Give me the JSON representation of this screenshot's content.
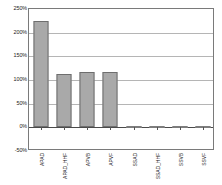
{
  "chart_data": {
    "type": "bar",
    "title": "",
    "xlabel": "",
    "ylabel": "",
    "categories": [
      "APAD",
      "APAD_HHF",
      "APVB",
      "APVF",
      "SSAD",
      "SSAD_HHF",
      "SSVB",
      "SSVF"
    ],
    "values": [
      225,
      112,
      117,
      117,
      0,
      0,
      0,
      0
    ],
    "value_labels": [
      "225%",
      "112%",
      "117%",
      "117%",
      "0%",
      "0%",
      "0%",
      "0%"
    ],
    "ylim": [
      -50,
      250
    ],
    "ytick_values": [
      250,
      200,
      150,
      100,
      50,
      0,
      -50
    ],
    "ytick_labels": [
      "250%",
      "200%",
      "150%",
      "100%",
      "50%",
      "0%",
      "-50%"
    ],
    "grid": true,
    "legend": false,
    "legend_position": "none",
    "series": [
      {
        "name": "series-1",
        "values": [
          225,
          112,
          117,
          117,
          0,
          0,
          0,
          0
        ]
      }
    ],
    "colors": {
      "bar_fill": "#a9a9a9",
      "bar_border": "#6e6e6e",
      "gridline": "#b5b5b5",
      "axis_frame": "#7a7a7a",
      "zero_line": "#4a4a4a",
      "text": "#1a1a1a",
      "background": "#ffffff"
    }
  }
}
